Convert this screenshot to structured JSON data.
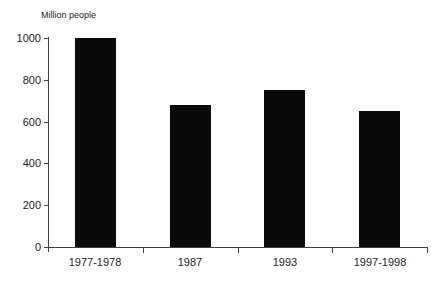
{
  "chart_data": {
    "type": "bar",
    "title": "",
    "xlabel": "",
    "ylabel": "Million people",
    "categories": [
      "1977-1978",
      "1987",
      "1993",
      "1997-1998"
    ],
    "values": [
      1000,
      680,
      750,
      650
    ],
    "ylim": [
      0,
      1000
    ],
    "yticks": [
      0,
      200,
      400,
      600,
      800,
      1000
    ],
    "grid": false,
    "legend": "none",
    "bar_color": "#0a0a0a",
    "axis_color": "#404040",
    "text_color": "#1c1c1c",
    "background_color": "#ffffff"
  }
}
